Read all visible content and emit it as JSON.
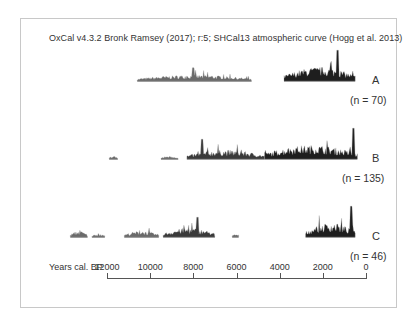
{
  "chart_data": {
    "type": "area",
    "title": "OxCal v4.3.2 Bronk Ramsey (2017); r:5; SHCal13 atmospheric curve (Hogg et al. 2013)",
    "xlabel": "Years cal. BP",
    "ylabel": "",
    "x_ticks": [
      12000,
      10000,
      8000,
      6000,
      4000,
      2000,
      0
    ],
    "x_tick_labels": [
      "12000",
      "10000",
      "8000",
      "6000",
      "4000",
      "2000",
      "0"
    ],
    "xlim": [
      12000,
      0
    ],
    "x_reversed": true,
    "grid": false,
    "legend": "none",
    "series": [
      {
        "name": "A",
        "n_label": "(n = 70)",
        "n": 70,
        "segments": [
          {
            "from": 10600,
            "to": 5300,
            "relative_density": "low",
            "peak_at": 8000
          },
          {
            "from": 3800,
            "to": 500,
            "relative_density": "high",
            "peak_at": 1300
          }
        ]
      },
      {
        "name": "B",
        "n_label": "(n = 135)",
        "n": 135,
        "segments": [
          {
            "from": 11900,
            "to": 11500,
            "relative_density": "very-low"
          },
          {
            "from": 9500,
            "to": 8700,
            "relative_density": "very-low"
          },
          {
            "from": 8300,
            "to": 4700,
            "relative_density": "medium",
            "peak_at": 7600
          },
          {
            "from": 4700,
            "to": 400,
            "relative_density": "high",
            "peak_at": 600
          }
        ]
      },
      {
        "name": "C",
        "n_label": "(n = 46)",
        "n": 46,
        "segments": [
          {
            "from": 13700,
            "to": 12900,
            "relative_density": "low"
          },
          {
            "from": 12700,
            "to": 12100,
            "relative_density": "very-low"
          },
          {
            "from": 11200,
            "to": 9600,
            "relative_density": "low"
          },
          {
            "from": 9400,
            "to": 7000,
            "relative_density": "medium",
            "peak_at": 7800
          },
          {
            "from": 6200,
            "to": 5900,
            "relative_density": "very-low"
          },
          {
            "from": 2800,
            "to": 500,
            "relative_density": "high",
            "peak_at": 700
          }
        ]
      }
    ]
  },
  "labels": {
    "title": "OxCal v4.3.2 Bronk Ramsey (2017); r:5; SHCal13 atmospheric curve (Hogg et al. 2013)",
    "axis_label": "Years cal. BP",
    "ticks": [
      "12000",
      "10000",
      "8000",
      "6000",
      "4000",
      "2000",
      "0"
    ],
    "series_a": "A",
    "series_a_n": "(n = 70)",
    "series_b": "B",
    "series_b_n": "(n = 135)",
    "series_c": "C",
    "series_c_n": "(n = 46)"
  }
}
